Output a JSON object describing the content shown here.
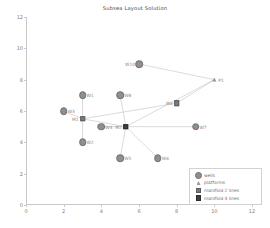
{
  "title": "Subsea Layout Solution",
  "axes": {
    "xlabel": "",
    "ylabel": "",
    "xticks": [
      "0",
      "2",
      "4",
      "6",
      "8",
      "10",
      "12"
    ],
    "yticks": [
      "0",
      "2",
      "4",
      "6",
      "8",
      "10",
      "12"
    ]
  },
  "legend": {
    "items": [
      {
        "label": "wells",
        "icon": "filled-circle-marker"
      },
      {
        "label": "platforms",
        "icon": "triangle-marker"
      },
      {
        "label": "manifold 2 lines",
        "icon": "small-square-marker"
      },
      {
        "label": "manifold 4 lines",
        "icon": "small-dark-square-marker"
      }
    ]
  },
  "colors": {
    "well": "#8f8f8f",
    "platform": "#9a9a9a",
    "manifold2": "#7a7a7a",
    "manifold4": "#3f3f3f",
    "link": "#bdbdbd",
    "axis": "#c9c9c9",
    "text": "#808080"
  },
  "chart_data": {
    "type": "scatter",
    "title": "Subsea Layout Solution",
    "xlabel": "",
    "ylabel": "",
    "xlim": [
      0,
      12
    ],
    "ylim": [
      0,
      12
    ],
    "grid": false,
    "legend_position": "lower right",
    "series": [
      {
        "name": "wells",
        "marker": "circle",
        "points": [
          {
            "label": "W1",
            "x": 3,
            "y": 7,
            "label_side": "right"
          },
          {
            "label": "W2",
            "x": 3,
            "y": 4,
            "label_side": "right"
          },
          {
            "label": "W3",
            "x": 2,
            "y": 6,
            "label_side": "right"
          },
          {
            "label": "W4",
            "x": 4,
            "y": 5,
            "label_side": "right"
          },
          {
            "label": "W5",
            "x": 5,
            "y": 3,
            "label_side": "right"
          },
          {
            "label": "W6",
            "x": 7,
            "y": 3,
            "label_side": "right"
          },
          {
            "label": "W7",
            "x": 9,
            "y": 5,
            "label_side": "right"
          },
          {
            "label": "W8",
            "x": 5,
            "y": 7,
            "label_side": "right"
          },
          {
            "label": "W10",
            "x": 6,
            "y": 9,
            "label_side": "left"
          }
        ]
      },
      {
        "name": "platforms",
        "marker": "triangle",
        "points": [
          {
            "label": "P1",
            "x": 10,
            "y": 8,
            "label_side": "right"
          }
        ]
      },
      {
        "name": "manifold 2 lines",
        "marker": "square",
        "points": [
          {
            "label": "M1",
            "x": 3,
            "y": 5.5,
            "label_side": "left"
          },
          {
            "label": "M3",
            "x": 8,
            "y": 6.5,
            "label_side": "left"
          }
        ]
      },
      {
        "name": "manifold 4 lines",
        "marker": "dark-square",
        "points": [
          {
            "label": "M2",
            "x": 5.3,
            "y": 5,
            "label_side": "left"
          }
        ]
      }
    ],
    "links": [
      {
        "from": [
          3,
          7
        ],
        "to": [
          3,
          5.5
        ]
      },
      {
        "from": [
          2,
          6
        ],
        "to": [
          3,
          5.5
        ]
      },
      {
        "from": [
          3,
          4
        ],
        "to": [
          3,
          5.5
        ]
      },
      {
        "from": [
          3,
          5.5
        ],
        "to": [
          5.3,
          5
        ]
      },
      {
        "from": [
          4,
          5
        ],
        "to": [
          5.3,
          5
        ]
      },
      {
        "from": [
          5,
          7
        ],
        "to": [
          5.3,
          5
        ]
      },
      {
        "from": [
          5,
          3
        ],
        "to": [
          5.3,
          5
        ]
      },
      {
        "from": [
          7,
          3
        ],
        "to": [
          5.3,
          5
        ]
      },
      {
        "from": [
          9,
          5
        ],
        "to": [
          5.3,
          5
        ]
      },
      {
        "from": [
          5.3,
          5
        ],
        "to": [
          10,
          8
        ]
      },
      {
        "from": [
          8,
          6.5
        ],
        "to": [
          10,
          8
        ]
      },
      {
        "from": [
          6,
          9
        ],
        "to": [
          10,
          8
        ]
      },
      {
        "from": [
          8,
          6.5
        ],
        "to": [
          3,
          5.5
        ]
      }
    ]
  }
}
